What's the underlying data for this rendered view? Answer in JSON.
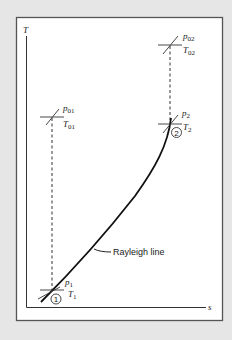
{
  "diagram": {
    "axes": {
      "y_label": "T",
      "x_label": "s"
    },
    "points": {
      "p01": {
        "p_label": "p",
        "p_sub": "01",
        "t_label": "T",
        "t_sub": "01"
      },
      "p02": {
        "p_label": "p",
        "p_sub": "02",
        "t_label": "T",
        "t_sub": "02"
      },
      "p1": {
        "p_label": "p",
        "p_sub": "1",
        "t_label": "T",
        "t_sub": "1",
        "state": "1"
      },
      "p2": {
        "p_label": "p",
        "p_sub": "2",
        "t_label": "T",
        "t_sub": "2",
        "state": "2"
      }
    },
    "curve_label": "Rayleigh line",
    "colors": {
      "background": "#e6e6e6",
      "panel": "#ffffff",
      "ink": "#222222"
    }
  }
}
